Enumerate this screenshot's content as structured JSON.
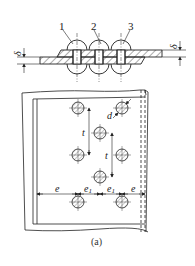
{
  "figure": {
    "caption": "(a)",
    "section_view": {
      "callouts": [
        {
          "id": "callout-1",
          "label": "1"
        },
        {
          "id": "callout-2",
          "label": "2"
        },
        {
          "id": "callout-3",
          "label": "3"
        }
      ],
      "thickness_left": "δ",
      "thickness_right": "δ"
    },
    "plan_view": {
      "pitch_label_1": "t",
      "pitch_label_2": "t",
      "diameter_label": "d",
      "edge_dims": [
        "e",
        "e1",
        "e1",
        "e"
      ],
      "edge_main": "e",
      "edge_sub": "1"
    }
  },
  "colors": {
    "line": "#222222",
    "hatch": "#555555",
    "background": "#ffffff"
  }
}
